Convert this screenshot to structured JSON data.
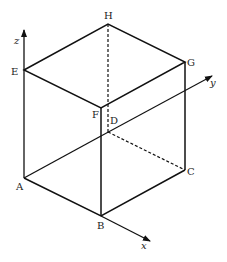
{
  "diagram": {
    "type": "3D cube with coordinate axes",
    "vertices": {
      "A": {
        "label": "A",
        "x": 24,
        "y": 178
      },
      "B": {
        "label": "B",
        "x": 101,
        "y": 216
      },
      "C": {
        "label": "C",
        "x": 185,
        "y": 170
      },
      "D": {
        "label": "D",
        "x": 108,
        "y": 132
      },
      "E": {
        "label": "E",
        "x": 24,
        "y": 70
      },
      "F": {
        "label": "F",
        "x": 101,
        "y": 108
      },
      "G": {
        "label": "G",
        "x": 185,
        "y": 62
      },
      "H": {
        "label": "H",
        "x": 108,
        "y": 24
      }
    },
    "axes": {
      "x": {
        "label": "x"
      },
      "y": {
        "label": "y"
      },
      "z": {
        "label": "z"
      }
    },
    "solid_edges": [
      "AB",
      "BC",
      "AE",
      "EF",
      "FB",
      "EH",
      "HG",
      "GF",
      "GC"
    ],
    "dashed_edges": [
      "DH",
      "DC",
      "AD"
    ],
    "colors": {
      "line": "#111111",
      "background": "#ffffff"
    }
  }
}
